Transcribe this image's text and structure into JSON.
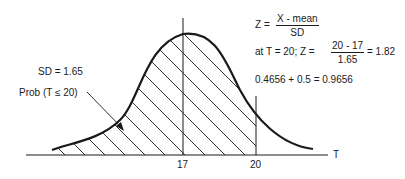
{
  "diagram": {
    "type": "normal-distribution",
    "sd_label": "SD = 1.65",
    "prob_label": "Prob (T ≤ 20)",
    "axis_label": "T",
    "ticks": [
      {
        "label": "17",
        "value": 17
      },
      {
        "label": "20",
        "value": 20
      }
    ],
    "shaded_region": "T <= 20",
    "formula": {
      "lhs": "Z =",
      "numerator": "X - mean",
      "denominator": "SD"
    },
    "calculation": {
      "prefix": "at T = 20; Z =",
      "numerator": "20 - 17",
      "denominator": "1.65",
      "result": "= 1.82"
    },
    "sum_line": "0.4656 + 0.5 = 0.9656",
    "mean": 17,
    "sd": 1.65,
    "colors": {
      "line": "#1a1a1a",
      "background": "#ffffff"
    }
  }
}
